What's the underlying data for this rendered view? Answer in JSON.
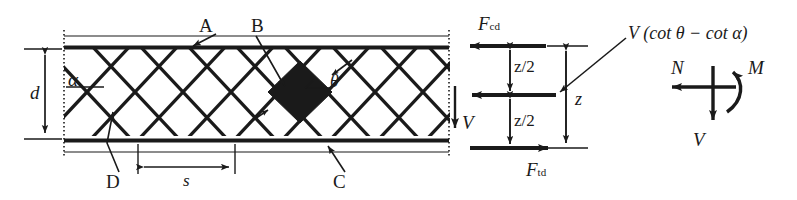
{
  "figure": {
    "type": "engineering-diagram",
    "ink_color": "#1a1a1a",
    "background": "#ffffff"
  },
  "truss_panel": {
    "callouts": [
      {
        "key": "A",
        "label": "A",
        "meaning": "compression chord",
        "x": 205,
        "y": 26
      },
      {
        "key": "B",
        "label": "B",
        "meaning": "compression field / concrete strut node",
        "x": 257,
        "y": 26
      },
      {
        "key": "C",
        "label": "C",
        "meaning": "tension chord",
        "x": 337,
        "y": 182
      },
      {
        "key": "D",
        "label": "D",
        "meaning": "shear reinforcement",
        "x": 110,
        "y": 182
      }
    ],
    "angles": [
      {
        "key": "alpha",
        "label": "α",
        "meaning": "inclination of shear reinforcement",
        "x": 72,
        "y": 80
      },
      {
        "key": "theta",
        "label": "θ",
        "meaning": "inclination of concrete compression strut",
        "x": 320,
        "y": 82
      }
    ],
    "dimensions": [
      {
        "key": "d",
        "label": "d",
        "meaning": "effective depth",
        "x": 36,
        "y": 92
      },
      {
        "key": "s",
        "label": "s",
        "meaning": "spacing of shear reinforcement",
        "x": 186,
        "y": 178
      }
    ]
  },
  "force_diagram": {
    "forces": [
      {
        "key": "Fcd",
        "label": "F",
        "sub": "cd",
        "meaning": "compression chord force",
        "x": 482,
        "y": 22
      },
      {
        "key": "Ftd",
        "label": "F",
        "sub": "td",
        "meaning": "tension chord force",
        "x": 530,
        "y": 175
      },
      {
        "key": "V",
        "label": "V",
        "meaning": "shear force",
        "x": 467,
        "y": 122
      }
    ],
    "dimensions": [
      {
        "key": "z_upper",
        "label": "z/2",
        "x": 514,
        "y": 65
      },
      {
        "key": "z_lower",
        "label": "z/2",
        "x": 514,
        "y": 122
      },
      {
        "key": "z",
        "label": "z",
        "meaning": "inner lever arm",
        "x": 578,
        "y": 100
      }
    ],
    "annotation": {
      "key": "shear_resultant",
      "text": "V (cot θ − cot α)",
      "x": 630,
      "y": 35
    }
  },
  "stress_resultants": {
    "caption": "section force resultants",
    "items": [
      {
        "key": "N",
        "label": "N",
        "meaning": "axial force",
        "x": 678,
        "y": 68
      },
      {
        "key": "M",
        "label": "M",
        "meaning": "bending moment",
        "x": 753,
        "y": 68
      },
      {
        "key": "V",
        "label": "V",
        "meaning": "shear force",
        "x": 700,
        "y": 140
      }
    ]
  }
}
